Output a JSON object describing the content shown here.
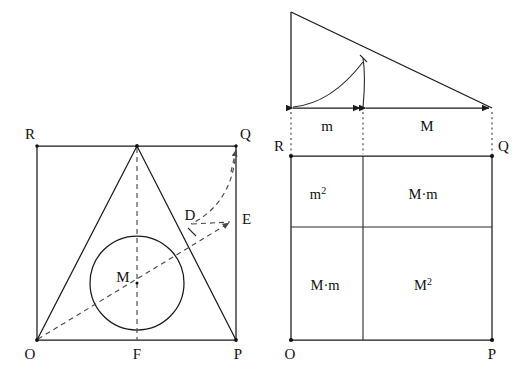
{
  "figure": {
    "type": "geometry-diagram",
    "background_color": "#ffffff",
    "line_color": "#1a1a1a",
    "panels": [
      {
        "id": "left-panel",
        "name": "incircle-square-construction",
        "vertex_labels": {
          "bottom_left": "O",
          "bottom_mid": "F",
          "bottom_right": "P",
          "top_left": "R",
          "top_right": "Q",
          "circle_center": "M",
          "tangency_point": "D",
          "right_edge_point": "E"
        }
      },
      {
        "id": "right-panel-top",
        "name": "right-triangle-segment-construction",
        "segment_labels": [
          "m",
          "M"
        ]
      },
      {
        "id": "right-panel-bottom",
        "name": "area-decomposition-square",
        "vertex_labels": {
          "bottom_left": "O",
          "bottom_right": "P",
          "top_left": "R",
          "top_right": "Q"
        },
        "cells": [
          {
            "position": "top-left",
            "base": "m",
            "exponent": "2",
            "label": "m2"
          },
          {
            "position": "top-right",
            "base": "M·m",
            "exponent": "",
            "label": "M·m"
          },
          {
            "position": "bottom-left",
            "base": "M·m",
            "exponent": "",
            "label": "M·m"
          },
          {
            "position": "bottom-right",
            "base": "M",
            "exponent": "2",
            "label": "M2"
          }
        ]
      }
    ]
  },
  "labels": {
    "left": {
      "R": "R",
      "Q": "Q",
      "O": "O",
      "F": "F",
      "P": "P",
      "M": "M",
      "D": "D",
      "E": "E"
    },
    "right_triangle": {
      "m": "m",
      "M": "M"
    },
    "right_square": {
      "R": "R",
      "Q": "Q",
      "O": "O",
      "P": "P",
      "cell_tl_base": "m",
      "cell_tl_sup": "2",
      "cell_tr": "M·m",
      "cell_bl": "M·m",
      "cell_br_base": "M",
      "cell_br_sup": "2"
    }
  }
}
